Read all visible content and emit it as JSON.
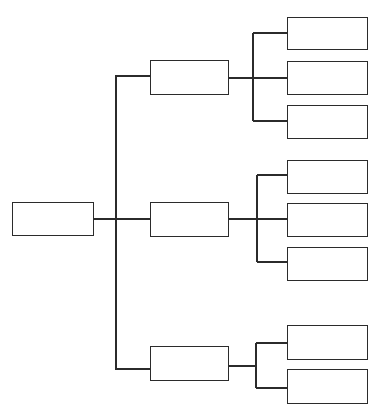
{
  "diagram": {
    "type": "tree-org-chart",
    "orientation": "left-to-right",
    "line_color": "#2b2b2b",
    "box_border_color": "#2b2b2b",
    "background": "#ffffff",
    "root": {
      "label": "",
      "children": [
        {
          "label": "",
          "children": [
            {
              "label": ""
            },
            {
              "label": ""
            },
            {
              "label": ""
            }
          ]
        },
        {
          "label": "",
          "children": [
            {
              "label": ""
            },
            {
              "label": ""
            },
            {
              "label": ""
            }
          ]
        },
        {
          "label": "",
          "children": [
            {
              "label": ""
            },
            {
              "label": ""
            }
          ]
        }
      ]
    }
  }
}
